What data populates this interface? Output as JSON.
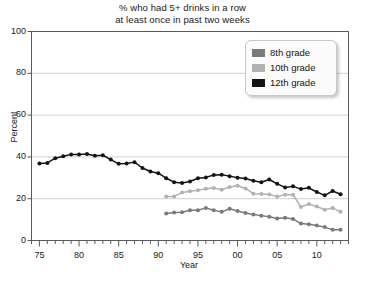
{
  "chart_data": {
    "type": "line",
    "title": "% who had 5+ drinks in a row at least once in past two weeks",
    "title_line1": "% who had 5+ drinks in a row",
    "title_line2": "at least once in past two weeks",
    "xlabel": "Year",
    "ylabel": "Percent",
    "ylim": [
      0,
      100
    ],
    "yticks": [
      0,
      20,
      40,
      60,
      80,
      100
    ],
    "ytick_labels": [
      "0",
      "20",
      "40",
      "60",
      "80",
      "100"
    ],
    "xlim": [
      1974,
      2014
    ],
    "xticks": [
      1975,
      1980,
      1985,
      1990,
      1995,
      2000,
      2005,
      2010
    ],
    "xtick_labels": [
      "75",
      "80",
      "85",
      "90",
      "95",
      "00",
      "05",
      "10"
    ],
    "minor_xticks_every": 1,
    "grid": "horizontal",
    "legend_position": "top-right",
    "markers": "circle",
    "series": [
      {
        "name": "8th grade",
        "color": "#7a7a7a",
        "x": [
          1991,
          1992,
          1993,
          1994,
          1995,
          1996,
          1997,
          1998,
          1999,
          2000,
          2001,
          2002,
          2003,
          2004,
          2005,
          2006,
          2007,
          2008,
          2009,
          2010,
          2011,
          2012,
          2013
        ],
        "values": [
          12.9,
          13.4,
          13.5,
          14.5,
          14.5,
          15.6,
          14.5,
          13.7,
          15.2,
          14.1,
          13.2,
          12.4,
          11.9,
          11.4,
          10.5,
          10.9,
          10.3,
          8.1,
          7.8,
          7.2,
          6.4,
          5.1,
          5.1
        ]
      },
      {
        "name": "10th grade",
        "color": "#b2b2b2",
        "x": [
          1991,
          1992,
          1993,
          1994,
          1995,
          1996,
          1997,
          1998,
          1999,
          2000,
          2001,
          2002,
          2003,
          2004,
          2005,
          2006,
          2007,
          2008,
          2009,
          2010,
          2011,
          2012,
          2013
        ],
        "values": [
          21.0,
          21.1,
          23.0,
          23.6,
          24.0,
          24.8,
          25.1,
          24.3,
          25.6,
          26.2,
          24.9,
          22.4,
          22.2,
          22.0,
          21.0,
          21.9,
          21.9,
          16.0,
          17.5,
          16.3,
          14.7,
          15.6,
          13.7
        ]
      },
      {
        "name": "12th grade",
        "color": "#141414",
        "x": [
          1975,
          1976,
          1977,
          1978,
          1979,
          1980,
          1981,
          1982,
          1983,
          1984,
          1985,
          1986,
          1987,
          1988,
          1989,
          1990,
          1991,
          1992,
          1993,
          1994,
          1995,
          1996,
          1997,
          1998,
          1999,
          2000,
          2001,
          2002,
          2003,
          2004,
          2005,
          2006,
          2007,
          2008,
          2009,
          2010,
          2011,
          2012,
          2013
        ],
        "values": [
          36.8,
          37.1,
          39.4,
          40.3,
          41.2,
          41.2,
          41.4,
          40.5,
          40.8,
          38.7,
          36.7,
          36.8,
          37.5,
          34.7,
          33.0,
          32.2,
          29.8,
          27.9,
          27.5,
          28.2,
          29.8,
          30.2,
          31.3,
          31.5,
          30.8,
          30.0,
          29.7,
          28.6,
          27.9,
          29.2,
          27.1,
          25.4,
          25.9,
          24.6,
          25.2,
          23.2,
          21.6,
          23.7,
          22.1
        ]
      }
    ]
  },
  "legend": {
    "entries": [
      {
        "label": "8th grade",
        "color": "#7a7a7a"
      },
      {
        "label": "10th grade",
        "color": "#b2b2b2"
      },
      {
        "label": "12th grade",
        "color": "#141414"
      }
    ]
  }
}
